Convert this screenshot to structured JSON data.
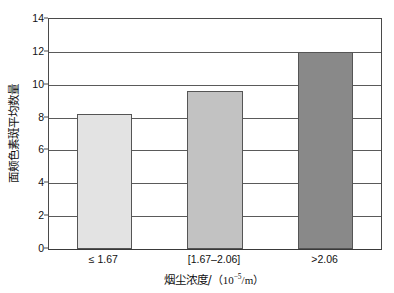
{
  "chart_data": {
    "type": "bar",
    "title": "",
    "subtitle": "",
    "categories": [
      "≤ 1.67",
      "[1.67–2.06]",
      ">2.06"
    ],
    "values": [
      8.2,
      9.6,
      12.0
    ],
    "series": [
      {
        "name": "面颊色素斑平均数量",
        "values": [
          8.2,
          9.6,
          12.0
        ]
      }
    ],
    "xlabel": "烟尘浓度/（ 10⁻⁵/m ）",
    "xlabel_parts": {
      "text": "烟尘浓度/",
      "open_paren": "（",
      "base": "10",
      "exponent": "−5",
      "denominator": "/m",
      "close_paren": "）"
    },
    "ylabel": "面颊色素斑平均数量",
    "ylim": [
      0,
      14
    ],
    "ytick_values": [
      0,
      2,
      4,
      6,
      8,
      10,
      12,
      14
    ],
    "ytick_labels": [
      "0",
      "2",
      "4",
      "6",
      "8",
      "10",
      "12",
      "14"
    ],
    "grid": true,
    "grid_axis": "y",
    "legend": false,
    "legend_position": "none",
    "bar_colors": [
      "#e3e3e3",
      "#c2c2c2",
      "#898989"
    ],
    "bar_edge_color": "#555555",
    "axis_color": "#4a4a4a",
    "grid_color": "#5a5a5a",
    "background_color": "#ffffff",
    "bar_width_fraction": 0.5
  }
}
